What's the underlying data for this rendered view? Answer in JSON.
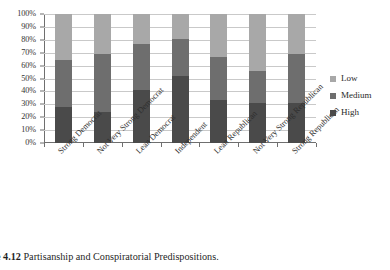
{
  "caption": {
    "prefix": "ure 4.12",
    "text": "Partisanship and Conspiratorial Predispositions."
  },
  "legend": {
    "position": "right",
    "items": [
      {
        "label": "Low",
        "color": "#a8a8a8"
      },
      {
        "label": "Medium",
        "color": "#6e6e6e"
      },
      {
        "label": "High",
        "color": "#4a4a4a"
      }
    ]
  },
  "axis": {
    "y_ticks": [
      "0%",
      "10%",
      "20%",
      "30%",
      "40%",
      "50%",
      "60%",
      "70%",
      "80%",
      "90%",
      "100%"
    ]
  },
  "chart_data": {
    "type": "bar",
    "stacked": true,
    "normalized": true,
    "title": "",
    "xlabel": "",
    "ylabel": "",
    "ylim": [
      0,
      100
    ],
    "grid": true,
    "legend_position": "right",
    "categories": [
      "Strong Democrat",
      "Not Very Strong Democrat",
      "Lean Democrat",
      "Independent",
      "Lean Republican",
      "Not Very Strong Republican",
      "Strong Republican"
    ],
    "series": [
      {
        "name": "High",
        "color": "#4a4a4a",
        "values": [
          28,
          24,
          41,
          52,
          33,
          31,
          31
        ]
      },
      {
        "name": "Medium",
        "color": "#6e6e6e",
        "values": [
          36,
          45,
          36,
          29,
          34,
          25,
          38
        ]
      },
      {
        "name": "Low",
        "color": "#a8a8a8",
        "values": [
          36,
          31,
          23,
          19,
          33,
          44,
          31
        ]
      }
    ]
  }
}
